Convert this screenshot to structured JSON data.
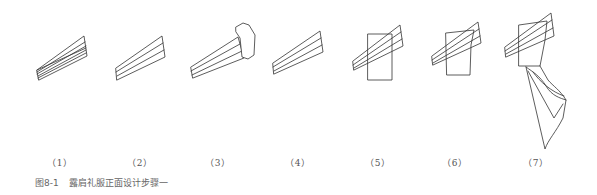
{
  "figure": {
    "caption_number": "图8-1",
    "caption_text": "露肩礼服正面设计步骤一",
    "stroke_color": "#333333",
    "steps": [
      {
        "label": "（1）",
        "x": 60
      },
      {
        "label": "（2）",
        "x": 140
      },
      {
        "label": "（3）",
        "x": 218
      },
      {
        "label": "（4）",
        "x": 298
      },
      {
        "label": "（5）",
        "x": 378
      },
      {
        "label": "（6）",
        "x": 455
      },
      {
        "label": "（7）",
        "x": 536
      }
    ]
  }
}
